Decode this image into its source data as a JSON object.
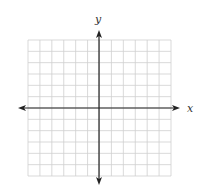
{
  "diagram": {
    "type": "coordinate-plane",
    "grid": {
      "columns": 12,
      "rows": 12,
      "left": 28,
      "top": 40,
      "right": 171,
      "bottom": 176,
      "color": "#cfcfcf"
    },
    "axes": {
      "color": "#222222",
      "x_axis": {
        "label": "x",
        "y": 108,
        "x_start": 18,
        "x_end": 180
      },
      "y_axis": {
        "label": "y",
        "x": 99,
        "y_start": 30,
        "y_end": 185
      }
    }
  }
}
